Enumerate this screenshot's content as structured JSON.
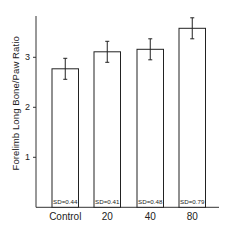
{
  "chart_data": {
    "type": "bar",
    "title": "",
    "xlabel": "",
    "ylabel": "Forelimb Long Bone/Paw Ratio",
    "categories": [
      "Control",
      "20",
      "40",
      "80"
    ],
    "values": [
      2.77,
      3.11,
      3.16,
      3.58
    ],
    "error": [
      0.21,
      0.21,
      0.21,
      0.21
    ],
    "annotations": [
      "SD=0.44",
      "SD=0.41",
      "SD=0.48",
      "SD=0.79"
    ],
    "yticks": [
      "1",
      "2",
      "3"
    ],
    "ytick_values": [
      1,
      2,
      3
    ],
    "ylim": [
      0,
      3.8
    ],
    "grid": false,
    "legend": null,
    "bar_fill": "#ffffff",
    "bar_stroke": "#222222"
  }
}
